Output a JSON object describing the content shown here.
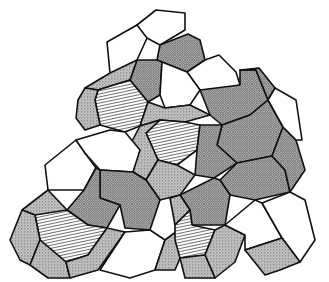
{
  "figure": {
    "colors": {
      "stroke": "#111111",
      "background": "#ffffff",
      "stipple": "#b8b8b8",
      "crosshatch": "#a9a9a9",
      "hatch_line": "#444444",
      "white": "#ffffff"
    },
    "face_styles": [
      "white",
      "stipple",
      "crosshatch",
      "hatch"
    ],
    "faces": [
      {
        "style": "white",
        "points": "107,42 137,25 156,15 147,38 137,60 120,72 110,73"
      },
      {
        "style": "white",
        "points": "137,25 156,10 185,13 185,30 160,45 147,38"
      },
      {
        "style": "crosshatch",
        "points": "160,45 188,34 200,40 205,60 187,72 162,62 157,60"
      },
      {
        "style": "crosshatch",
        "points": "137,60 157,60 162,62 160,95 148,102 130,80"
      },
      {
        "style": "stipple",
        "points": "110,73 137,60 130,80 98,90 85,88"
      },
      {
        "style": "hatch",
        "points": "98,90 130,80 148,102 140,126 125,132 100,125 95,100"
      },
      {
        "style": "stipple",
        "points": "85,88 98,90 95,100 100,125 85,130 76,118 78,100"
      },
      {
        "style": "white",
        "points": "187,72 205,60 219,55 236,72 240,85 225,90 200,90"
      },
      {
        "style": "white",
        "points": "162,62 187,72 200,90 190,105 165,108 160,95"
      },
      {
        "style": "crosshatch",
        "points": "200,90 240,85 240,70 256,70 268,100 250,115 222,125 210,115"
      },
      {
        "style": "crosshatch",
        "points": "240,70 259,68 275,88 268,100 256,70"
      },
      {
        "style": "crosshatch",
        "points": "222,125 250,115 268,100 283,127 272,156 237,163 217,145"
      },
      {
        "style": "stipple",
        "points": "140,126 148,102 165,108 190,105 200,110 210,115 185,122 160,120"
      },
      {
        "style": "hatch",
        "points": "160,120 185,122 200,125 197,150 177,165 158,160 146,133"
      },
      {
        "style": "stipple",
        "points": "140,126 160,120 146,133 158,160 146,180 133,172 130,145"
      },
      {
        "style": "crosshatch",
        "points": "200,125 222,125 217,145 237,163 214,178 195,175 197,150"
      },
      {
        "style": "stipple",
        "points": "158,160 177,165 195,175 180,195 160,200 146,180"
      },
      {
        "style": "white",
        "points": "45,165 76,140 85,153 96,168 84,190 48,190"
      },
      {
        "style": "white",
        "points": "76,140 110,130 125,132 140,150 133,172 100,170 85,153"
      },
      {
        "style": "crosshatch",
        "points": "100,170 133,172 146,180 160,200 150,230 125,228 120,205 100,198"
      },
      {
        "style": "crosshatch",
        "points": "84,190 96,168 100,170 100,198 120,205 107,228 88,225 67,210"
      },
      {
        "style": "stipple",
        "points": "22,210 48,190 67,210 70,215 35,215"
      },
      {
        "style": "hatch",
        "points": "35,215 67,210 88,225 107,228 88,255 66,262 40,240"
      },
      {
        "style": "stipple",
        "points": "10,240 22,210 35,215 40,240 30,265 20,260"
      },
      {
        "style": "stipple",
        "points": "30,265 40,240 66,262 70,278 48,278"
      },
      {
        "style": "stipple",
        "points": "66,262 88,255 107,228 125,232 98,270 70,278"
      },
      {
        "style": "white",
        "points": "125,232 150,230 165,240 155,270 130,278 100,270"
      },
      {
        "style": "stipple",
        "points": "155,270 165,240 185,225 190,235 175,270"
      },
      {
        "style": "crosshatch",
        "points": "237,163 272,156 285,170 290,192 255,200 230,195 220,180"
      },
      {
        "style": "crosshatch",
        "points": "180,195 214,178 220,180 230,195 225,225 192,225 190,210"
      },
      {
        "style": "stipple",
        "points": "170,198 180,195 190,210 175,225"
      },
      {
        "style": "hatch",
        "points": "175,225 190,210 192,225 215,230 205,255 180,258 175,240"
      },
      {
        "style": "stipple",
        "points": "205,255 215,230 225,225 245,235 235,262 215,278"
      },
      {
        "style": "stipple",
        "points": "180,258 205,255 215,278 185,278"
      },
      {
        "style": "white",
        "points": "225,225 255,200 262,203 282,238 245,250 245,235"
      },
      {
        "style": "white",
        "points": "290,192 305,200 315,240 300,262 282,238 262,203"
      },
      {
        "style": "stipple",
        "points": "282,238 300,262 280,270 265,275 245,250"
      },
      {
        "style": "crosshatch",
        "points": "283,127 296,140 305,170 290,192 285,170 272,156"
      },
      {
        "style": "white",
        "points": "275,88 296,100 302,140 296,140 283,127 268,100"
      }
    ]
  }
}
